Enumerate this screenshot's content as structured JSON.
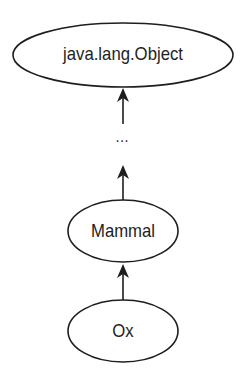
{
  "diagram": {
    "type": "class-hierarchy",
    "nodes": [
      {
        "id": "object",
        "label": "java.lang.Object"
      },
      {
        "id": "ellipsis",
        "label": "…"
      },
      {
        "id": "mammal",
        "label": "Mammal"
      },
      {
        "id": "ox",
        "label": "Ox"
      }
    ],
    "edges": [
      {
        "from": "ox",
        "to": "mammal"
      },
      {
        "from": "mammal",
        "to": "ellipsis"
      },
      {
        "from": "ellipsis",
        "to": "object"
      }
    ],
    "colors": {
      "stroke": "#1e1e1e",
      "fill": "#ffffff",
      "text": "#1e1e1e"
    }
  }
}
